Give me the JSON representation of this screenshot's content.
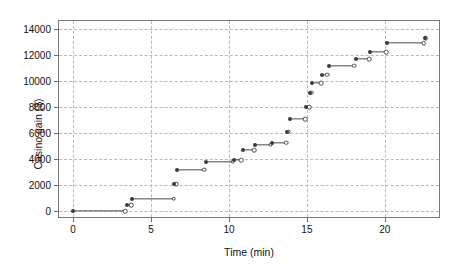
{
  "chart_data": {
    "type": "line",
    "title": "",
    "xlabel": "Time (min)",
    "ylabel": "Casino gain ($)",
    "xlim": [
      -0.9,
      23.6
    ],
    "ylim": [
      -600,
      14600
    ],
    "xticks": [
      0,
      5,
      10,
      15,
      20
    ],
    "xticklabels": [
      "0",
      "5",
      "10",
      "15",
      "20"
    ],
    "yticks": [
      0,
      2000,
      4000,
      6000,
      8000,
      10000,
      12000,
      14000
    ],
    "yticklabels": [
      "0",
      "2000",
      "4000",
      "6000",
      "8000",
      "10000",
      "12000",
      "14000"
    ],
    "grid": true,
    "legend": false,
    "style": "step-function with filled start markers and open end markers",
    "colors": {
      "line": "#4a4a4a",
      "marker_filled": "#3b3b3b",
      "marker_open_edge": "#4a4a4a",
      "marker_open_fill": "#ffffff",
      "grid": "#b9b9b9",
      "frame": "#7a7a7a",
      "background": "#ffffff"
    },
    "segments": [
      {
        "x_start": 0.0,
        "x_end": 3.35,
        "y": 0
      },
      {
        "x_start": 3.45,
        "x_end": 3.72,
        "y": 450
      },
      {
        "x_start": 3.8,
        "x_end": 6.45,
        "y": 950
      },
      {
        "x_start": 6.5,
        "x_end": 6.62,
        "y": 2050
      },
      {
        "x_start": 6.65,
        "x_end": 8.4,
        "y": 3200
      },
      {
        "x_start": 8.5,
        "x_end": 10.25,
        "y": 3790
      },
      {
        "x_start": 10.32,
        "x_end": 10.8,
        "y": 3920
      },
      {
        "x_start": 10.88,
        "x_end": 11.62,
        "y": 4660
      },
      {
        "x_start": 11.7,
        "x_end": 12.68,
        "y": 5110
      },
      {
        "x_start": 12.75,
        "x_end": 13.68,
        "y": 5250
      },
      {
        "x_start": 13.74,
        "x_end": 13.84,
        "y": 6100
      },
      {
        "x_start": 13.9,
        "x_end": 14.88,
        "y": 7080
      },
      {
        "x_start": 14.94,
        "x_end": 15.14,
        "y": 7970
      },
      {
        "x_start": 15.18,
        "x_end": 15.26,
        "y": 9110
      },
      {
        "x_start": 15.3,
        "x_end": 15.9,
        "y": 9830
      },
      {
        "x_start": 15.95,
        "x_end": 16.32,
        "y": 10480
      },
      {
        "x_start": 16.4,
        "x_end": 18.05,
        "y": 11180
      },
      {
        "x_start": 18.12,
        "x_end": 19.0,
        "y": 11660
      },
      {
        "x_start": 19.06,
        "x_end": 20.08,
        "y": 12200
      },
      {
        "x_start": 20.15,
        "x_end": 22.48,
        "y": 12900
      },
      {
        "x_start": 22.55,
        "x_end": 22.62,
        "y": 13270
      }
    ]
  }
}
